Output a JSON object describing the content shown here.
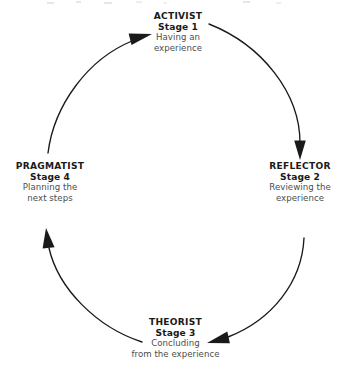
{
  "diagram": {
    "type": "cycle",
    "direction": "clockwise",
    "background_color": "#ffffff",
    "line_color": "#1a1a1a",
    "heading_color": "#1a1a1a",
    "description_color": "#4d4d4d",
    "nodes": [
      {
        "id": "activist",
        "position": "top",
        "role": "ACTIVIST",
        "stage": "Stage 1",
        "desc_line1": "Having an",
        "desc_line2": "experience"
      },
      {
        "id": "reflector",
        "position": "right",
        "role": "REFLECTOR",
        "stage": "Stage 2",
        "desc_line1": "Reviewing the",
        "desc_line2": "experience"
      },
      {
        "id": "theorist",
        "position": "bottom",
        "role": "THEORIST",
        "stage": "Stage 3",
        "desc_line1": "Concluding",
        "desc_line2": "from the experience"
      },
      {
        "id": "pragmatist",
        "position": "left",
        "role": "PRAGMATIST",
        "stage": "Stage 4",
        "desc_line1": "Planning the",
        "desc_line2": "next steps"
      }
    ],
    "arrows": [
      {
        "id": "arrow-activist-to-reflector",
        "from": "activist",
        "to": "reflector",
        "side": "right"
      },
      {
        "id": "arrow-reflector-to-theorist",
        "from": "reflector",
        "to": "theorist",
        "side": "bottom-right"
      },
      {
        "id": "arrow-theorist-to-pragmatist",
        "from": "theorist",
        "to": "pragmatist",
        "side": "bottom-left"
      },
      {
        "id": "arrow-pragmatist-to-activist",
        "from": "pragmatist",
        "to": "activist",
        "side": "top-left"
      }
    ]
  }
}
